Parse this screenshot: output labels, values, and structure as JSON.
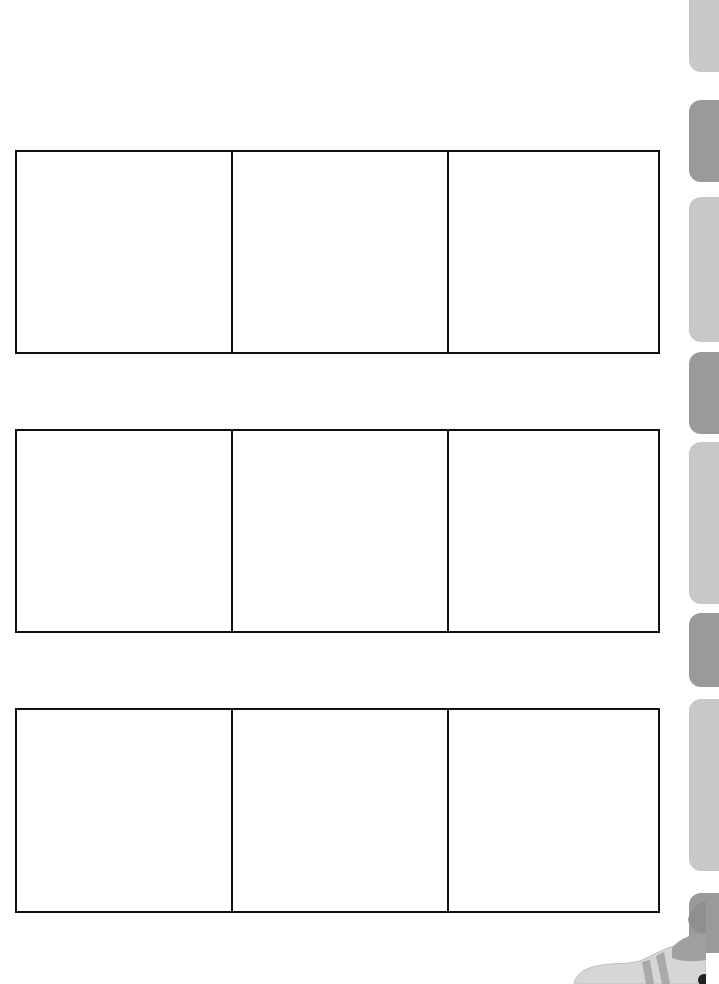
{
  "page": {
    "type": "storyboard-worksheet",
    "grid_rows": 3,
    "grid_columns": 3
  },
  "grids": [
    {
      "row": 1,
      "cells": [
        "",
        "",
        ""
      ]
    },
    {
      "row": 2,
      "cells": [
        "",
        "",
        ""
      ]
    },
    {
      "row": 3,
      "cells": [
        "",
        "",
        ""
      ]
    }
  ],
  "side_tabs": [
    {
      "shade": "light",
      "color": "#c8c8c8"
    },
    {
      "shade": "dark",
      "color": "#9a9a9a"
    },
    {
      "shade": "light",
      "color": "#c8c8c8"
    },
    {
      "shade": "dark",
      "color": "#9a9a9a"
    },
    {
      "shade": "light",
      "color": "#c8c8c8"
    },
    {
      "shade": "dark",
      "color": "#9a9a9a"
    },
    {
      "shade": "light",
      "color": "#c8c8c8"
    },
    {
      "shade": "dark",
      "color": "#9a9a9a"
    }
  ],
  "decoration": {
    "mascot_icon": "cat-paw-illustration"
  },
  "colors": {
    "line": "#111111",
    "background": "#ffffff",
    "tab_light": "#c8c8c8",
    "tab_dark": "#9a9a9a"
  }
}
